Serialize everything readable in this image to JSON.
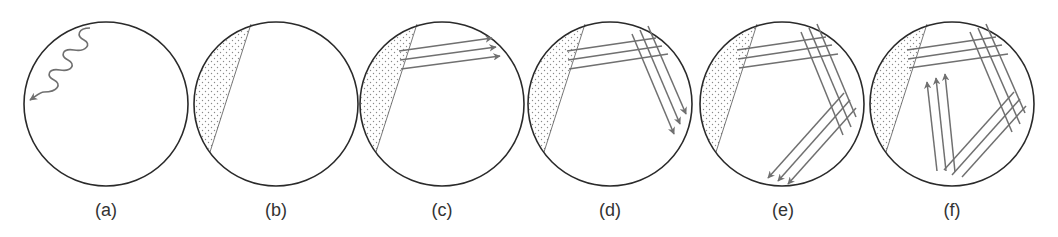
{
  "figure": {
    "type": "diagram",
    "colors": {
      "circle_stroke": "#2a2a2a",
      "ray_stroke": "#707070",
      "stipple": "#8a8a8a",
      "label": "#333333",
      "background": "#ffffff"
    },
    "panels": [
      {
        "id": "a",
        "label": "(a)",
        "content": "wavy-arrow"
      },
      {
        "id": "b",
        "label": "(b)",
        "content": "dotted-sliver"
      },
      {
        "id": "c",
        "label": "(c)",
        "content": "sliver + 3 parallel rays right"
      },
      {
        "id": "d",
        "label": "(d)",
        "content": "sliver + rays reflected down-right"
      },
      {
        "id": "e",
        "label": "(e)",
        "content": "sliver + rays reflected down-left"
      },
      {
        "id": "f",
        "label": "(f)",
        "content": "sliver + rays reflected up"
      }
    ]
  }
}
